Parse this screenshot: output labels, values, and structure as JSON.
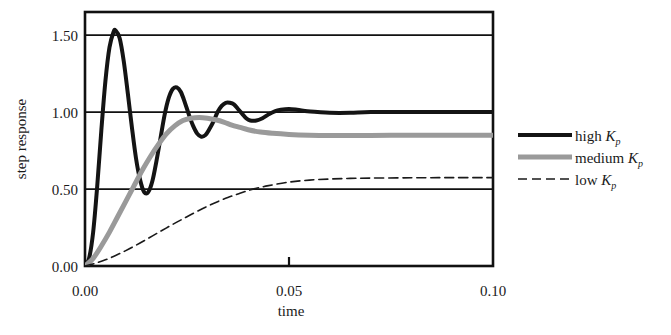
{
  "chart_data": {
    "type": "line",
    "title": "",
    "xlabel": "time",
    "ylabel": "step response",
    "xlim": [
      0.0,
      0.1
    ],
    "ylim": [
      0.0,
      1.65
    ],
    "grid": true,
    "grid_axis": "y",
    "legend_position": "right",
    "x_ticks": [
      "0.00",
      "0.05",
      "0.10"
    ],
    "x_tick_values": [
      0.0,
      0.05,
      0.1
    ],
    "y_ticks": [
      "0.00",
      "0.50",
      "1.00",
      "1.50"
    ],
    "y_tick_values": [
      0.0,
      0.5,
      1.0,
      1.5
    ],
    "series": [
      {
        "name": "high Kp",
        "label_text": "high",
        "label_symbol": "K",
        "label_subscript": "p",
        "color": "#141414",
        "style": "solid",
        "width": 4,
        "x": [
          0.0,
          0.001,
          0.002,
          0.003,
          0.004,
          0.005,
          0.006,
          0.007,
          0.0075,
          0.0085,
          0.0095,
          0.0105,
          0.0115,
          0.0125,
          0.0135,
          0.0145,
          0.0155,
          0.0165,
          0.0175,
          0.0185,
          0.0195,
          0.0205,
          0.0215,
          0.0225,
          0.0235,
          0.0245,
          0.0255,
          0.0265,
          0.0275,
          0.0285,
          0.0295,
          0.0305,
          0.0315,
          0.0325,
          0.0335,
          0.0345,
          0.0355,
          0.0365,
          0.0375,
          0.0385,
          0.0395,
          0.0405,
          0.042,
          0.0435,
          0.045,
          0.0465,
          0.048,
          0.05,
          0.052,
          0.0545,
          0.057,
          0.06,
          0.065,
          0.07,
          0.08,
          0.09,
          0.1
        ],
        "y": [
          0.0,
          0.05,
          0.22,
          0.52,
          0.88,
          1.2,
          1.42,
          1.52,
          1.53,
          1.48,
          1.33,
          1.12,
          0.9,
          0.7,
          0.56,
          0.48,
          0.48,
          0.55,
          0.68,
          0.83,
          0.98,
          1.09,
          1.15,
          1.16,
          1.13,
          1.06,
          0.98,
          0.91,
          0.86,
          0.84,
          0.85,
          0.89,
          0.94,
          1.0,
          1.04,
          1.06,
          1.06,
          1.05,
          1.02,
          0.99,
          0.96,
          0.945,
          0.945,
          0.96,
          0.985,
          1.005,
          1.015,
          1.02,
          1.015,
          1.005,
          1.0,
          0.995,
          0.995,
          1.0,
          1.0,
          1.0,
          1.0
        ]
      },
      {
        "name": "medium Kp",
        "label_text": "medium",
        "label_symbol": "K",
        "label_subscript": "p",
        "color": "#9a9a9a",
        "style": "solid",
        "width": 5,
        "x": [
          0.0,
          0.002,
          0.004,
          0.006,
          0.008,
          0.01,
          0.012,
          0.014,
          0.016,
          0.018,
          0.02,
          0.022,
          0.024,
          0.026,
          0.028,
          0.03,
          0.032,
          0.034,
          0.036,
          0.038,
          0.04,
          0.043,
          0.046,
          0.05,
          0.055,
          0.06,
          0.07,
          0.08,
          0.09,
          0.1
        ],
        "y": [
          0.0,
          0.05,
          0.13,
          0.22,
          0.32,
          0.42,
          0.52,
          0.62,
          0.71,
          0.79,
          0.86,
          0.91,
          0.945,
          0.96,
          0.965,
          0.96,
          0.95,
          0.935,
          0.915,
          0.9,
          0.885,
          0.87,
          0.862,
          0.855,
          0.85,
          0.848,
          0.848,
          0.85,
          0.85,
          0.85
        ]
      },
      {
        "name": "low Kp",
        "label_text": "low",
        "label_symbol": "K",
        "label_subscript": "p",
        "color": "#1a1a1a",
        "style": "dashed",
        "width": 1.6,
        "x": [
          0.0,
          0.0025,
          0.005,
          0.0075,
          0.01,
          0.0125,
          0.015,
          0.0175,
          0.02,
          0.0225,
          0.025,
          0.0275,
          0.03,
          0.0325,
          0.035,
          0.0375,
          0.04,
          0.0425,
          0.045,
          0.05,
          0.055,
          0.06,
          0.065,
          0.07,
          0.08,
          0.09,
          0.1
        ],
        "y": [
          0.0,
          0.018,
          0.04,
          0.068,
          0.1,
          0.135,
          0.172,
          0.21,
          0.248,
          0.285,
          0.32,
          0.355,
          0.388,
          0.418,
          0.445,
          0.468,
          0.49,
          0.508,
          0.522,
          0.545,
          0.558,
          0.565,
          0.569,
          0.571,
          0.573,
          0.574,
          0.574
        ]
      }
    ]
  },
  "axes": {
    "y_label": "step response",
    "x_label": "time",
    "x_tick_labels": [
      "0.00",
      "0.05",
      "0.10"
    ],
    "y_tick_labels": [
      "1.50",
      "1.00",
      "0.50",
      "0.00"
    ]
  },
  "legend": {
    "items": [
      {
        "label": "high",
        "symbol": "K",
        "subscript": "p",
        "style": "solid-black"
      },
      {
        "label": "medium",
        "symbol": "K",
        "subscript": "p",
        "style": "solid-gray"
      },
      {
        "label": "low",
        "symbol": "K",
        "subscript": "p",
        "style": "dashed"
      }
    ]
  },
  "colors": {
    "high": "#141414",
    "medium": "#9a9a9a",
    "low": "#1a1a1a",
    "frame": "#111111",
    "background": "#ffffff"
  }
}
